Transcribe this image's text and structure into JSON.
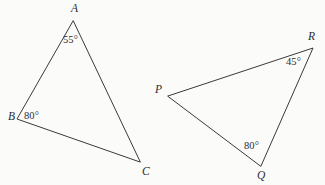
{
  "figure": {
    "background_color": "#fbfbfa",
    "line_color": "#3a3a3a",
    "text_color": "#2b2b2b",
    "width": 325,
    "height": 185
  },
  "triangles": [
    {
      "id": "triangle-abc",
      "name": "ABC",
      "vertices": [
        {
          "label": "A",
          "x": 73,
          "y": 21
        },
        {
          "label": "B",
          "x": 17,
          "y": 119
        },
        {
          "label": "C",
          "x": 140,
          "y": 162
        }
      ],
      "angles": [
        {
          "at": "A",
          "value": "55°"
        },
        {
          "at": "B",
          "value": "80°"
        }
      ]
    },
    {
      "id": "triangle-pqr",
      "name": "PQR",
      "vertices": [
        {
          "label": "P",
          "x": 168,
          "y": 96
        },
        {
          "label": "R",
          "x": 313,
          "y": 48
        },
        {
          "label": "Q",
          "x": 261,
          "y": 166
        }
      ],
      "angles": [
        {
          "at": "R",
          "value": "45°"
        },
        {
          "at": "Q",
          "value": "80°"
        }
      ]
    }
  ],
  "labels": {
    "A": "A",
    "B": "B",
    "C": "C",
    "P": "P",
    "Q": "Q",
    "R": "R",
    "angle_A": "55°",
    "angle_B": "80°",
    "angle_R": "45°",
    "angle_Q": "80°"
  }
}
